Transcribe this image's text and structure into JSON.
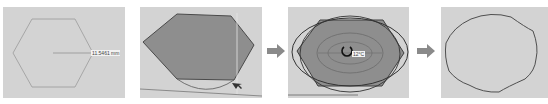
{
  "figure": {
    "steps": [
      {
        "id": 1,
        "description": "Hexagon outline with radius measurement",
        "radius_label": "11.5461 mm"
      },
      {
        "id": 2,
        "description": "Filled hexagon with arc drawn at bottom edge"
      },
      {
        "id": 3,
        "description": "Filled hexagon with overlapping ellipses and rotate cursor",
        "cursor_label": "12°C"
      },
      {
        "id": 4,
        "description": "Resulting wavy rounded hexagon outline"
      }
    ],
    "arrows": [
      {
        "from": 2,
        "to": 3,
        "icon": "arrow-right-icon"
      },
      {
        "from": 3,
        "to": 4,
        "icon": "arrow-right-icon"
      }
    ],
    "colors": {
      "panel_bg": "#d3d3d3",
      "hex_fill": "#8e8e8e",
      "outline": "#555555",
      "arrow": "#8a8a8a"
    }
  }
}
